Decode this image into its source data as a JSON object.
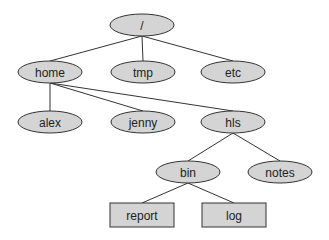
{
  "diagram": {
    "type": "directory-tree",
    "colors": {
      "node_fill": "#d4d4d4",
      "stroke": "#333333",
      "text": "#222222",
      "background": "#ffffff"
    },
    "nodes": [
      {
        "id": "root",
        "label": "/",
        "shape": "ellipse",
        "cx": 142,
        "cy": 25,
        "w": 64,
        "h": 22
      },
      {
        "id": "home",
        "label": "home",
        "shape": "ellipse",
        "cx": 50,
        "cy": 72,
        "w": 64,
        "h": 22
      },
      {
        "id": "tmp",
        "label": "tmp",
        "shape": "ellipse",
        "cx": 143,
        "cy": 72,
        "w": 64,
        "h": 22
      },
      {
        "id": "etc",
        "label": "etc",
        "shape": "ellipse",
        "cx": 233,
        "cy": 72,
        "w": 64,
        "h": 22
      },
      {
        "id": "alex",
        "label": "alex",
        "shape": "ellipse",
        "cx": 50,
        "cy": 122,
        "w": 64,
        "h": 22
      },
      {
        "id": "jenny",
        "label": "jenny",
        "shape": "ellipse",
        "cx": 143,
        "cy": 122,
        "w": 64,
        "h": 22
      },
      {
        "id": "hls",
        "label": "hls",
        "shape": "ellipse",
        "cx": 233,
        "cy": 122,
        "w": 64,
        "h": 22
      },
      {
        "id": "bin",
        "label": "bin",
        "shape": "ellipse",
        "cx": 188,
        "cy": 172,
        "w": 64,
        "h": 22
      },
      {
        "id": "notes",
        "label": "notes",
        "shape": "ellipse",
        "cx": 280,
        "cy": 172,
        "w": 64,
        "h": 22
      },
      {
        "id": "report",
        "label": "report",
        "shape": "rect",
        "cx": 142,
        "cy": 215,
        "w": 64,
        "h": 24
      },
      {
        "id": "log",
        "label": "log",
        "shape": "rect",
        "cx": 234,
        "cy": 215,
        "w": 64,
        "h": 24
      }
    ],
    "edges": [
      {
        "from": "root",
        "to": "home"
      },
      {
        "from": "root",
        "to": "tmp"
      },
      {
        "from": "root",
        "to": "etc"
      },
      {
        "from": "home",
        "to": "alex"
      },
      {
        "from": "home",
        "to": "jenny"
      },
      {
        "from": "home",
        "to": "hls"
      },
      {
        "from": "hls",
        "to": "bin"
      },
      {
        "from": "hls",
        "to": "notes"
      },
      {
        "from": "bin",
        "to": "report"
      },
      {
        "from": "bin",
        "to": "log"
      }
    ]
  }
}
